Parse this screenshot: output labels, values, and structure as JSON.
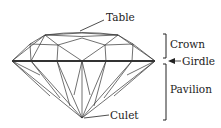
{
  "diagram": {
    "labels": {
      "table": "Table",
      "crown": "Crown",
      "girdle": "Girdle",
      "pavilion": "Pavilion",
      "culet": "Culet"
    },
    "colors": {
      "line": "#333333",
      "background": "#ffffff"
    }
  }
}
